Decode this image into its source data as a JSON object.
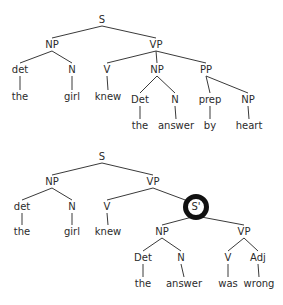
{
  "trees": [
    {
      "name": "tree-1",
      "nodes": [
        {
          "id": "S",
          "label": "S",
          "x": 102,
          "y": 23
        },
        {
          "id": "NP1",
          "label": "NP",
          "x": 52,
          "y": 48,
          "parent": "S"
        },
        {
          "id": "VP1",
          "label": "VP",
          "x": 156,
          "y": 48,
          "parent": "S"
        },
        {
          "id": "det1",
          "label": "det",
          "x": 20,
          "y": 73,
          "parent": "NP1"
        },
        {
          "id": "N1",
          "label": "N",
          "x": 72,
          "y": 73,
          "parent": "NP1"
        },
        {
          "id": "the1",
          "label": "the",
          "x": 20,
          "y": 100,
          "parent": "det1"
        },
        {
          "id": "girl1",
          "label": "girl",
          "x": 72,
          "y": 100,
          "parent": "N1"
        },
        {
          "id": "V1",
          "label": "V",
          "x": 107,
          "y": 73,
          "parent": "VP1"
        },
        {
          "id": "knew1",
          "label": "knew",
          "x": 108,
          "y": 100,
          "parent": "V1"
        },
        {
          "id": "NP2",
          "label": "NP",
          "x": 157,
          "y": 73,
          "parent": "VP1"
        },
        {
          "id": "PP1",
          "label": "PP",
          "x": 206,
          "y": 73,
          "parent": "VP1"
        },
        {
          "id": "Det2",
          "label": "Det",
          "x": 140,
          "y": 103,
          "parent": "NP2"
        },
        {
          "id": "N2",
          "label": "N",
          "x": 175,
          "y": 103,
          "parent": "NP2"
        },
        {
          "id": "the2",
          "label": "the",
          "x": 140,
          "y": 129,
          "parent": "Det2"
        },
        {
          "id": "answer2",
          "label": "answer",
          "x": 176,
          "y": 129,
          "parent": "N2"
        },
        {
          "id": "prep1",
          "label": "prep",
          "x": 210,
          "y": 103,
          "parent": "PP1"
        },
        {
          "id": "NP3",
          "label": "NP",
          "x": 248,
          "y": 103,
          "parent": "PP1"
        },
        {
          "id": "by1",
          "label": "by",
          "x": 210,
          "y": 129,
          "parent": "prep1"
        },
        {
          "id": "heart1",
          "label": "heart",
          "x": 249,
          "y": 129,
          "parent": "NP3"
        }
      ]
    },
    {
      "name": "tree-2",
      "nodes": [
        {
          "id": "S",
          "label": "S",
          "x": 102,
          "y": 160
        },
        {
          "id": "NP1",
          "label": "NP",
          "x": 52,
          "y": 185,
          "parent": "S"
        },
        {
          "id": "VP1",
          "label": "VP",
          "x": 153,
          "y": 185,
          "parent": "S"
        },
        {
          "id": "det1",
          "label": "det",
          "x": 22,
          "y": 210,
          "parent": "NP1"
        },
        {
          "id": "N1",
          "label": "N",
          "x": 72,
          "y": 210,
          "parent": "NP1"
        },
        {
          "id": "the1",
          "label": "the",
          "x": 22,
          "y": 235,
          "parent": "det1"
        },
        {
          "id": "girl1",
          "label": "girl",
          "x": 72,
          "y": 235,
          "parent": "N1"
        },
        {
          "id": "V1",
          "label": "V",
          "x": 107,
          "y": 210,
          "parent": "VP1"
        },
        {
          "id": "knew1",
          "label": "knew",
          "x": 108,
          "y": 235,
          "parent": "V1"
        },
        {
          "id": "Sbar",
          "label": "S'",
          "x": 196,
          "y": 210,
          "parent": "VP1",
          "highlight": true
        },
        {
          "id": "NP2",
          "label": "NP",
          "x": 162,
          "y": 235,
          "parent": "Sbar"
        },
        {
          "id": "VP2",
          "label": "VP",
          "x": 244,
          "y": 235,
          "parent": "Sbar"
        },
        {
          "id": "Det2",
          "label": "Det",
          "x": 143,
          "y": 261,
          "parent": "NP2"
        },
        {
          "id": "N2",
          "label": "N",
          "x": 181,
          "y": 261,
          "parent": "NP2"
        },
        {
          "id": "the2",
          "label": "the",
          "x": 143,
          "y": 287,
          "parent": "Det2"
        },
        {
          "id": "answer2",
          "label": "answer",
          "x": 184,
          "y": 287,
          "parent": "N2"
        },
        {
          "id": "V2",
          "label": "V",
          "x": 228,
          "y": 261,
          "parent": "VP2"
        },
        {
          "id": "Adj2",
          "label": "Adj",
          "x": 258,
          "y": 261,
          "parent": "VP2"
        },
        {
          "id": "was2",
          "label": "was",
          "x": 228,
          "y": 287,
          "parent": "V2"
        },
        {
          "id": "wrong2",
          "label": "wrong",
          "x": 259,
          "y": 287,
          "parent": "Adj2"
        }
      ]
    }
  ],
  "colors": {
    "line": "#3a3a3a",
    "text": "#2b2b2b",
    "highlight_ring": "#111111"
  }
}
